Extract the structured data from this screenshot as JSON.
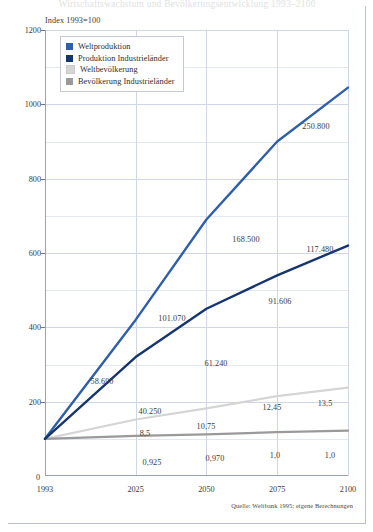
{
  "figure": {
    "headline_faded": "Wirtschaftswachstum und Bevölkerungsentwicklung 1993–2100",
    "index_caption": "Index 1993=100",
    "source_note": "Quelle: Weltbank 1995; eigene Berechnungen"
  },
  "legend": {
    "items": [
      {
        "label": "Weltproduktion",
        "color": "#2f5fa8"
      },
      {
        "label": "Produktion Industrieländer",
        "color": "#16356e"
      },
      {
        "label": "Weltbevölkerung",
        "color": "#d5d5d5"
      },
      {
        "label": "Bevölkerung Industrieländer",
        "color": "#9a9a9a"
      }
    ]
  },
  "chart_data": {
    "type": "line",
    "title": "",
    "subtitle": "Index 1993=100",
    "xlabel": "",
    "ylabel": "",
    "x": [
      1993,
      2025,
      2050,
      2075,
      2100
    ],
    "xtick_labels": [
      "1993",
      "2025",
      "2050",
      "2075",
      "2100"
    ],
    "origin_label": "0",
    "xlim": [
      1993,
      2100
    ],
    "ylim": [
      0,
      1200
    ],
    "yticks": [
      200,
      400,
      600,
      800,
      1000,
      1200
    ],
    "ytick_labels": [
      "200",
      "400",
      "600",
      "800",
      "1000",
      "1200"
    ],
    "yticks_minor": [
      100,
      300,
      500,
      700,
      900,
      1100
    ],
    "grid": true,
    "legend_position": "upper-left-inset",
    "series": [
      {
        "name": "Weltproduktion",
        "color": "#2f5fa8",
        "values": [
          100,
          420,
          690,
          900,
          1045
        ],
        "point_labels": [
          "",
          "101.070",
          "168.500",
          "",
          "250.800"
        ],
        "value_unit": "Mrd. US-$",
        "absolute_values": [
          "23.500",
          "101.070",
          "168.500",
          "",
          "250.800"
        ]
      },
      {
        "name": "Produktion Industrieländer",
        "color": "#16356e",
        "values": [
          100,
          320,
          450,
          540,
          620
        ],
        "point_labels": [
          "",
          "58.690",
          "61.240",
          "91.606",
          "117.480"
        ],
        "absolute_values": [
          "",
          "58.690",
          "61.240",
          "91.606",
          "117.480"
        ]
      },
      {
        "name": "Weltbevölkerung",
        "color": "#d5d5d5",
        "values": [
          100,
          152,
          182,
          215,
          238
        ],
        "point_labels": [
          "",
          "8,5",
          "10,75",
          "12,45",
          "13,5"
        ],
        "value_unit": "Mrd. Menschen",
        "absolute_values": [
          "",
          "8,5",
          "10,75",
          "12,45",
          "13,5"
        ]
      },
      {
        "name": "Bevölkerung Industrieländer",
        "color": "#9a9a9a",
        "values": [
          100,
          108,
          112,
          118,
          122
        ],
        "point_labels": [
          "",
          "0,925",
          "0,970",
          "1,0",
          "1,0"
        ],
        "absolute_values": [
          "",
          "0,925",
          "0,970",
          "1,0",
          "1,0"
        ]
      }
    ],
    "annotations": [
      {
        "text": "58.690",
        "series": "Produktion Industrieländer",
        "x": 2025
      },
      {
        "text": "40.250",
        "series": "Produktion Industrieländer",
        "x": 2025
      },
      {
        "text": "101.070",
        "series": "Weltproduktion",
        "x": 2050
      },
      {
        "text": "61.240",
        "series": "Produktion Industrieländer",
        "x": 2050
      },
      {
        "text": "168.500",
        "series": "Weltproduktion",
        "x": 2075
      },
      {
        "text": "91.606",
        "series": "Produktion Industrieländer",
        "x": 2075
      },
      {
        "text": "250.800",
        "series": "Weltproduktion",
        "x": 2100
      },
      {
        "text": "117.480",
        "series": "Produktion Industrieländer",
        "x": 2100
      },
      {
        "text": "8,5",
        "series": "Weltbevölkerung",
        "x": 2025
      },
      {
        "text": "10,75",
        "series": "Weltbevölkerung",
        "x": 2050
      },
      {
        "text": "12,45",
        "series": "Weltbevölkerung",
        "x": 2075
      },
      {
        "text": "13,5",
        "series": "Weltbevölkerung",
        "x": 2100
      },
      {
        "text": "0,925",
        "series": "Bevölkerung Industrieländer",
        "x": 2025
      },
      {
        "text": "0,970",
        "series": "Bevölkerung Industrieländer",
        "x": 2050
      },
      {
        "text": "1,0",
        "series": "Bevölkerung Industrieländer",
        "x": 2075
      },
      {
        "text": "1,0",
        "series": "Bevölkerung Industrieländer",
        "x": 2100
      }
    ]
  },
  "point_label_positions": [
    {
      "text": "58.690",
      "left": 102,
      "top": 381
    },
    {
      "text": "40.250",
      "left": 150,
      "top": 411
    },
    {
      "text": "101.070",
      "left": 172,
      "top": 318
    },
    {
      "text": "61.240",
      "left": 216,
      "top": 363
    },
    {
      "text": "168.500",
      "left": 246,
      "top": 239
    },
    {
      "text": "91.606",
      "left": 280,
      "top": 301
    },
    {
      "text": "250.800",
      "left": 316,
      "top": 126
    },
    {
      "text": "117.480",
      "left": 320,
      "top": 249
    },
    {
      "text": "8,5",
      "left": 145,
      "top": 433
    },
    {
      "text": "10,75",
      "left": 206,
      "top": 426
    },
    {
      "text": "12,45",
      "left": 272,
      "top": 407
    },
    {
      "text": "13,5",
      "left": 325,
      "top": 403
    },
    {
      "text": "0,925",
      "left": 152,
      "top": 462
    },
    {
      "text": "0,970",
      "left": 215,
      "top": 458
    },
    {
      "text": "1,0",
      "left": 275,
      "top": 455
    },
    {
      "text": "1,0",
      "left": 330,
      "top": 455
    }
  ]
}
